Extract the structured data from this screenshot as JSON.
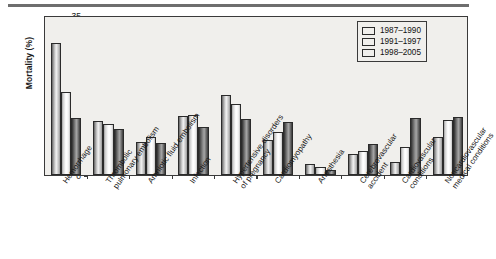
{
  "figure": {
    "ylabel": "Mortality (%)"
  },
  "legend": {
    "position": "top-right",
    "items": [
      {
        "label": "1987–1990",
        "color": "#d0d0d0",
        "name": "legend-swatch-1987-1990"
      },
      {
        "label": "1991–1997",
        "color": "#fbfbfb",
        "name": "legend-swatch-1991-1997"
      },
      {
        "label": "1998–2005",
        "color": "#6a6a6a",
        "name": "legend-swatch-1998-2005"
      }
    ]
  },
  "yaxis": {
    "ticks": [
      "0",
      "5",
      "10",
      "15",
      "20",
      "25",
      "30",
      "35"
    ]
  },
  "chart_data": {
    "type": "bar",
    "title": "",
    "xlabel": "",
    "ylabel": "Mortality (%)",
    "ylim": [
      0,
      35
    ],
    "ytick_step": 5,
    "grid": false,
    "legend_position": "top-right",
    "categories": [
      "Hemorrhage",
      "Thrombolic pulmonary embolism",
      "Amniotic fluid embolism",
      "Infection",
      "Hypertensive disorders of pregnancy",
      "Cardiomyopathy",
      "Anesthesia",
      "Cerebrovascular accident",
      "Cardiovascular conditions",
      "Noncardiovascular medical conditions"
    ],
    "series": [
      {
        "name": "1987–1990",
        "values": [
          28.8,
          11.8,
          7.3,
          13.0,
          17.5,
          7.7,
          2.4,
          4.5,
          2.8,
          8.3
        ]
      },
      {
        "name": "1991–1997",
        "values": [
          18.2,
          11.2,
          8.3,
          13.1,
          15.6,
          9.5,
          1.7,
          5.3,
          6.1,
          12.0
        ]
      },
      {
        "name": "1998–2005",
        "values": [
          12.4,
          10.0,
          7.1,
          10.6,
          12.2,
          11.6,
          1.0,
          6.8,
          12.4,
          12.8
        ]
      }
    ]
  }
}
